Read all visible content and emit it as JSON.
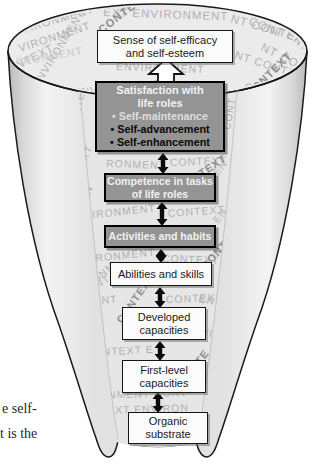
{
  "figure": {
    "boxes": {
      "sense": {
        "lines": [
          "Sense of self-efficacy",
          "and self-esteem"
        ]
      },
      "satisfaction": {
        "title_lines": [
          "Satisfaction with",
          "life roles"
        ],
        "bullets": [
          "• Self-maintenance",
          "• Self-advancement",
          "• Self-enhancement"
        ]
      },
      "competence": {
        "lines": [
          "Competence in tasks",
          "of life roles"
        ]
      },
      "activities": {
        "lines": [
          "Activities and habits"
        ]
      },
      "abilities": {
        "lines": [
          "Abilities and skills"
        ]
      },
      "developed": {
        "lines": [
          "Developed",
          "capacities"
        ]
      },
      "first_level": {
        "lines": [
          "First-level",
          "capacities"
        ]
      },
      "organic": {
        "lines": [
          "Organic",
          "substrate"
        ]
      }
    },
    "page_fragments": [
      "e self-",
      "t is the"
    ],
    "colors": {
      "gray_box_fill": "#949494",
      "gray_box_border": "#000000",
      "white_box_fill": "#fbfbfb",
      "funnel_wing": "#dedede",
      "funnel_strip": "#e6e6e6",
      "funnel_opening": "#ebebeb",
      "texture_text": "#b1b1b1",
      "texture_text_dark": "#8d8d8d",
      "arrow_black": "#0a0a0a",
      "up_arrow_fill": "#ffffff"
    },
    "texture_words": {
      "ellipse": [
        [
          "EXT ENVIRONMENT",
          103,
          16,
          2,
          11.5,
          0
        ],
        [
          "CONT",
          248,
          24,
          22,
          11.5,
          0
        ],
        [
          "CONTEXT",
          102,
          34,
          -38,
          11,
          1
        ],
        [
          "ENVIRONMENT",
          6,
          38,
          -16,
          11,
          0
        ],
        [
          "VIRONMENT",
          20,
          52,
          -18,
          11,
          0
        ],
        [
          "ENVIRONMENT",
          38,
          88,
          -58,
          10.5,
          0
        ],
        [
          "CONTEXT",
          2,
          78,
          -28,
          11,
          0
        ],
        [
          "NVIRONMENT",
          4,
          68,
          -10,
          10.5,
          2
        ],
        [
          "ENVIRONMENT",
          74,
          96,
          -6,
          10.5,
          0
        ],
        [
          "CONTEXT",
          148,
          100,
          -3,
          10.5,
          2
        ],
        [
          "NT CONTEXT ENVIR",
          230,
          22,
          16,
          11.5,
          0
        ],
        [
          "NT CO",
          260,
          50,
          26,
          11.5,
          0
        ],
        [
          "NT CONTEXT",
          234,
          58,
          18,
          11,
          0
        ],
        [
          "CONTEXT",
          250,
          98,
          -44,
          11,
          1
        ],
        [
          "CONTEXT E",
          244,
          90,
          10,
          10.5,
          0
        ],
        [
          "ENVIRONMENT",
          116,
          70,
          2,
          10.5,
          0
        ],
        [
          "ENVIR",
          286,
          36,
          38,
          11,
          0
        ]
      ],
      "strip": [
        [
          "CONTEXT",
          76,
          132,
          -78,
          10,
          0
        ],
        [
          "CONT",
          230,
          130,
          -80,
          10,
          0
        ],
        [
          "TEXT",
          80,
          174,
          -64,
          10,
          0
        ],
        [
          "RONMENT",
          106,
          167,
          2,
          10.5,
          0
        ],
        [
          "CONTEXT",
          170,
          166,
          -2,
          10.5,
          0
        ],
        [
          "CONTEXT",
          180,
          192,
          -34,
          10.5,
          1
        ],
        [
          "EN",
          88,
          202,
          -70,
          10,
          0
        ],
        [
          "EN",
          218,
          176,
          -52,
          10,
          0
        ],
        [
          "NVIRONMENT",
          76,
          220,
          -6,
          10.5,
          0
        ],
        [
          "CONTEXT",
          168,
          217,
          -4,
          10.5,
          0
        ],
        [
          "EN",
          218,
          224,
          -54,
          10,
          0
        ],
        [
          "VIRONMENT",
          84,
          263,
          -6,
          10.5,
          0
        ],
        [
          "CONTEXT",
          162,
          262,
          2,
          10.5,
          0
        ],
        [
          "ONM",
          96,
          284,
          -42,
          10,
          0
        ],
        [
          "MENT",
          84,
          298,
          -34,
          10,
          0
        ],
        [
          "CONTEXT",
          206,
          270,
          -48,
          10.5,
          1
        ],
        [
          "MENT",
          84,
          305,
          -4,
          10.5,
          0
        ],
        [
          "CONTEXT",
          166,
          303,
          -2,
          10.5,
          0
        ],
        [
          "ENVIR",
          198,
          302,
          10,
          10.5,
          0
        ],
        [
          "CONTEXT",
          122,
          324,
          -55,
          10.5,
          1
        ],
        [
          "MENT",
          62,
          340,
          -8,
          10.5,
          0
        ],
        [
          "NVIR",
          192,
          333,
          12,
          10.5,
          0
        ],
        [
          "VIRON",
          78,
          374,
          -62,
          10,
          0
        ],
        [
          "T CONTEXT E",
          74,
          357,
          -3,
          10.5,
          0
        ],
        [
          "CONTE",
          184,
          386,
          -52,
          10.5,
          1
        ],
        [
          "NVIRONMENT CONT",
          70,
          400,
          -2,
          10.5,
          0
        ],
        [
          "ONTEXT ENVIRON",
          82,
          415,
          -2,
          10.5,
          0
        ],
        [
          "NVIR",
          84,
          426,
          -6,
          10,
          0
        ]
      ]
    }
  }
}
